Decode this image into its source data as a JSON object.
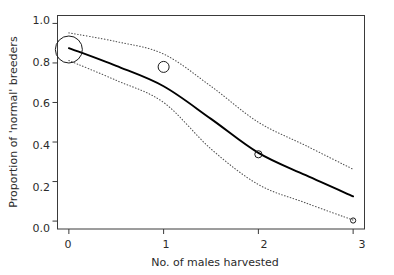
{
  "chart_data": {
    "type": "line",
    "title": "",
    "subtitle": "",
    "xlabel": "No. of males harvested",
    "ylabel": "Proportion of 'normal' breeders",
    "xlim": [
      -0.12,
      3.12
    ],
    "ylim": [
      -0.04,
      1.04
    ],
    "xticks": [
      0,
      1,
      2,
      3
    ],
    "xticklabels": [
      "0",
      "1",
      "2",
      "3"
    ],
    "yticks": [
      0.0,
      0.2,
      0.4,
      0.6,
      0.8,
      1.0
    ],
    "yticklabels": [
      "0.0",
      "0.2",
      "0.4",
      "0.6",
      "0.8",
      "1.0"
    ],
    "grid": false,
    "legend": "none",
    "series": [
      {
        "name": "fitted",
        "style": "solid",
        "color": "#000000",
        "x": [
          0.0,
          0.5,
          1.0,
          1.5,
          2.0,
          2.5,
          3.0
        ],
        "values": [
          0.875,
          0.785,
          0.682,
          0.517,
          0.345,
          0.232,
          0.125
        ]
      },
      {
        "name": "upper-confidence-limit",
        "style": "dotted",
        "color": "#555555",
        "x": [
          0.0,
          0.5,
          1.0,
          1.5,
          2.0,
          2.5,
          3.0
        ],
        "values": [
          0.952,
          0.908,
          0.845,
          0.682,
          0.5,
          0.382,
          0.262
        ]
      },
      {
        "name": "lower-confidence-limit",
        "style": "dotted",
        "color": "#555555",
        "x": [
          0.0,
          0.5,
          1.0,
          1.5,
          2.0,
          2.5,
          3.0
        ],
        "values": [
          0.812,
          0.712,
          0.6,
          0.365,
          0.185,
          0.092,
          0.005
        ]
      }
    ],
    "points": [
      {
        "label": "obs-0",
        "x": 0,
        "y": 0.868,
        "marker": "open-circle",
        "size": 13.5
      },
      {
        "label": "obs-1",
        "x": 1,
        "y": 0.78,
        "marker": "open-circle",
        "size": 5.5
      },
      {
        "label": "obs-2",
        "x": 2,
        "y": 0.338,
        "marker": "open-circle",
        "size": 3.6
      },
      {
        "label": "obs-3",
        "x": 3,
        "y": 0.003,
        "marker": "open-circle",
        "size": 2.6
      }
    ]
  },
  "axes": {
    "x_title": "No. of males harvested",
    "y_title": "Proportion of 'normal' breeders",
    "x_tick_0": "0",
    "x_tick_1": "1",
    "x_tick_2": "2",
    "x_tick_3": "3",
    "y_tick_0": "0.0",
    "y_tick_1": "0.2",
    "y_tick_2": "0.4",
    "y_tick_3": "0.6",
    "y_tick_4": "0.8",
    "y_tick_5": "1.0"
  },
  "colors": {
    "line": "#000000",
    "band": "#555555",
    "frame": "#3a3a3a",
    "background": "#ffffff"
  }
}
